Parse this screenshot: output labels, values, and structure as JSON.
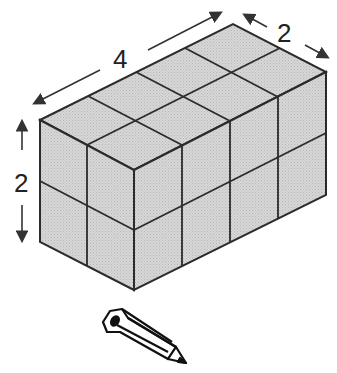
{
  "figure": {
    "dimensions": {
      "length": 4,
      "width": 2,
      "height": 2
    },
    "labels": {
      "length": "4",
      "width": "2",
      "height": "2"
    },
    "cube_count": 16,
    "colors": {
      "face": "#cfcfcf",
      "edge": "#2b2b2b",
      "arrow": "#333333",
      "background": "#ffffff"
    },
    "icon": "pencil-icon"
  }
}
